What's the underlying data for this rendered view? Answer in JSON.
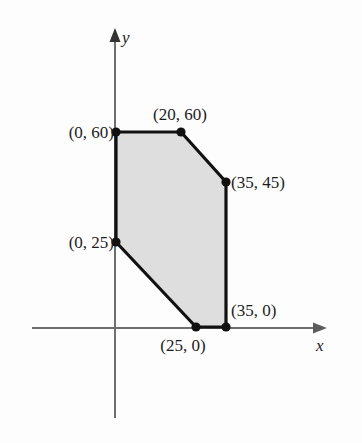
{
  "figure": {
    "type": "feasible-region-polygon",
    "background_color": "#fdfdfd",
    "axes": {
      "x_axis_label": "x",
      "y_axis_label": "y",
      "axis_color": "#6e6e6e",
      "origin_px": {
        "x": 115,
        "y": 328
      },
      "x_axis_extent_px": {
        "from": 32,
        "to": 327
      },
      "y_axis_extent_px": {
        "from": 28,
        "to": 418
      }
    },
    "region": {
      "fill_color": "#dedede",
      "edge_color": "#111111",
      "vertex_color": "#111111",
      "vertices": [
        {
          "label": "(0, 60)",
          "x": 0,
          "y": 60,
          "px": {
            "x": 116,
            "y": 132
          },
          "label_pos": {
            "x": 114,
            "y": 132
          },
          "anchor": "right"
        },
        {
          "label": "(20, 60)",
          "x": 20,
          "y": 60,
          "px": {
            "x": 181,
            "y": 132
          },
          "label_pos": {
            "x": 180,
            "y": 114
          },
          "anchor": "mid"
        },
        {
          "label": "(35, 45)",
          "x": 35,
          "y": 45,
          "px": {
            "x": 226,
            "y": 182
          },
          "label_pos": {
            "x": 231,
            "y": 182
          },
          "anchor": "left"
        },
        {
          "label": "(35, 0)",
          "x": 35,
          "y": 0,
          "px": {
            "x": 226,
            "y": 327
          },
          "label_pos": {
            "x": 231,
            "y": 310
          },
          "anchor": "left"
        },
        {
          "label": "(25, 0)",
          "x": 25,
          "y": 0,
          "px": {
            "x": 196,
            "y": 327
          },
          "label_pos": {
            "x": 183,
            "y": 345
          },
          "anchor": "mid"
        },
        {
          "label": "(0, 25)",
          "x": 0,
          "y": 25,
          "px": {
            "x": 116,
            "y": 242
          },
          "label_pos": {
            "x": 114,
            "y": 242
          },
          "anchor": "right"
        }
      ]
    }
  },
  "chart_data": {
    "type": "scatter",
    "title": "",
    "xlabel": "x",
    "ylabel": "y",
    "grid": false,
    "legend": null,
    "xlim": [
      -10,
      45
    ],
    "ylim": [
      -10,
      75
    ],
    "series": [
      {
        "name": "Feasible region vertices",
        "x": [
          0,
          20,
          35,
          35,
          25,
          0
        ],
        "y": [
          60,
          60,
          45,
          0,
          0,
          25
        ],
        "point_labels": [
          "(0, 60)",
          "(20, 60)",
          "(35, 45)",
          "(35, 0)",
          "(25, 0)",
          "(0, 25)"
        ],
        "closed_polygon": true,
        "fill": "#dedede"
      }
    ],
    "annotations": [
      "(0, 60)",
      "(20, 60)",
      "(35, 45)",
      "(35, 0)",
      "(25, 0)",
      "(0, 25)"
    ]
  }
}
